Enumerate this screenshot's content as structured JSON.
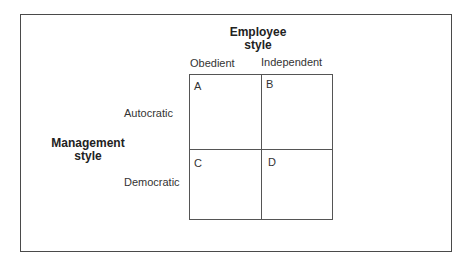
{
  "diagram": {
    "column_axis": {
      "title": "Employee style",
      "title_lines": [
        "Employee",
        "style"
      ],
      "columns": [
        "Obedient",
        "Independent"
      ]
    },
    "row_axis": {
      "title": "Management style",
      "title_lines": [
        "Management",
        "style"
      ],
      "rows": [
        "Autocratic",
        "Democratic"
      ]
    },
    "cells": [
      {
        "label": "A",
        "row": "Autocratic",
        "column": "Obedient"
      },
      {
        "label": "B",
        "row": "Autocratic",
        "column": "Independent"
      },
      {
        "label": "C",
        "row": "Democratic",
        "column": "Obedient"
      },
      {
        "label": "D",
        "row": "Democratic",
        "column": "Independent"
      }
    ]
  }
}
